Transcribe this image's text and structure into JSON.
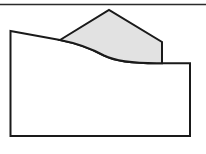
{
  "figure": {
    "canvas": {
      "width": 206,
      "height": 154,
      "background": "#ffffff"
    },
    "colors": {
      "outline": "#1a1a1a",
      "body_fill": "#ffffff",
      "overlay_fill": "#e2e2e2",
      "rule": "#2b2b2b"
    },
    "top_rule": {
      "name": "top-border-rule",
      "x1": 0,
      "y1": 4.5,
      "x2": 206,
      "y2": 4.5,
      "stroke_width": 1.6
    },
    "shapes": [
      {
        "name": "base-body-outline",
        "kind": "closed-path",
        "fill": "#ffffff",
        "stroke": "#1a1a1a",
        "stroke_width": 2.0,
        "path": "M 10.5 31 L 60 40 C 78 43.5 92 49 104 55.5 C 118 62.5 140 63.5 162 63.2 L 190 63.2 L 190 136 L 10.5 136 Z",
        "vertices": [
          [
            10.5,
            31
          ],
          [
            60,
            40
          ],
          [
            162,
            63.2
          ],
          [
            190,
            63.2
          ],
          [
            190,
            136
          ],
          [
            10.5,
            136
          ]
        ]
      },
      {
        "name": "upper-overlay-region",
        "kind": "closed-path",
        "fill": "#e2e2e2",
        "stroke": "#1a1a1a",
        "stroke_width": 2.0,
        "path": "M 60 40 L 109 10 L 162 42 L 162 63.2 C 140 63.5 118 62.5 104 55.5 C 92 49 78 43.5 60 40 Z",
        "vertices": [
          [
            60,
            40
          ],
          [
            109,
            10
          ],
          [
            162,
            42
          ],
          [
            162,
            63.2
          ]
        ]
      }
    ],
    "labels": []
  }
}
